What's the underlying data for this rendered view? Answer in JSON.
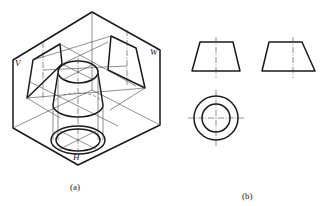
{
  "figure_a": {
    "caption": "(a)",
    "plane_labels": {
      "v": "V",
      "w": "W",
      "h": "H"
    },
    "description": "Isometric view of three projection planes with a frustum of a cone projected onto each"
  },
  "figure_b": {
    "caption": "(b)",
    "views": [
      "front-view-trapezoid",
      "side-view-trapezoid",
      "top-view-concentric-circles"
    ]
  },
  "colors": {
    "line": "#1a1a1a",
    "thin_line": "#444444",
    "background": "#ffffff"
  }
}
